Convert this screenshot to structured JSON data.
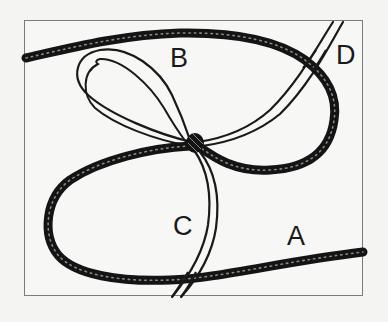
{
  "figure": {
    "type": "rope knot illustration",
    "labels": {
      "a": "A",
      "b": "B",
      "c": "C",
      "d": "D"
    },
    "ropes": [
      {
        "name": "thick-rope",
        "description": "thick dark textured rope forming two loops around the knot",
        "color": "#141414"
      },
      {
        "name": "thin-rope",
        "description": "thin double-line cord with bow loop B, running from D to C",
        "color": "#1a1a1a"
      }
    ],
    "colors": {
      "background": "#f4f4f2",
      "frame_border": "#7a7a7a",
      "ink": "#141414"
    }
  }
}
